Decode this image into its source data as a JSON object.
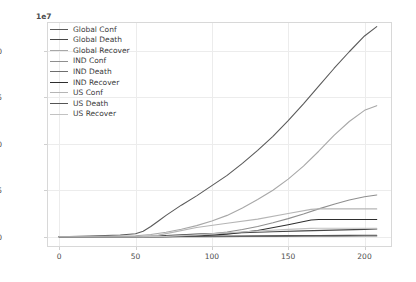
{
  "chart_data": {
    "type": "line",
    "title": "",
    "xlabel": "",
    "ylabel": "",
    "offset_text": "1e7",
    "xlim": [
      -8,
      218
    ],
    "ylim": [
      -1100000,
      23100000
    ],
    "xticks": [
      0,
      50,
      100,
      150,
      200
    ],
    "xtick_labels": [
      "0",
      "50",
      "100",
      "150",
      "200"
    ],
    "yticks": [
      0,
      5000000,
      10000000,
      15000000,
      20000000
    ],
    "ytick_labels": [
      "0.0",
      "0.5",
      "1.0",
      "1.5",
      "2.0"
    ],
    "grid": true,
    "legend_position": "upper left",
    "series": [
      {
        "name": "Global Conf",
        "color": "#5a5a5a",
        "x": [
          0,
          20,
          40,
          50,
          55,
          60,
          65,
          70,
          80,
          90,
          100,
          110,
          120,
          130,
          140,
          150,
          160,
          170,
          180,
          190,
          200,
          208
        ],
        "values": [
          0,
          75000,
          190000,
          330000,
          600000,
          1100000,
          1700000,
          2300000,
          3400000,
          4400000,
          5500000,
          6600000,
          7900000,
          9300000,
          10800000,
          12500000,
          14300000,
          16200000,
          18100000,
          19900000,
          21600000,
          22600000
        ]
      },
      {
        "name": "Global Death",
        "color": "#474747",
        "x": [
          0,
          20,
          40,
          50,
          60,
          70,
          80,
          90,
          100,
          120,
          140,
          160,
          180,
          200,
          208
        ],
        "values": [
          0,
          2000,
          8000,
          18000,
          60000,
          120000,
          200000,
          280000,
          340000,
          440000,
          540000,
          630000,
          720000,
          800000,
          830000
        ]
      },
      {
        "name": "Global Recover",
        "color": "#a8a8a8",
        "x": [
          0,
          20,
          40,
          50,
          60,
          70,
          80,
          90,
          100,
          110,
          120,
          130,
          140,
          150,
          160,
          170,
          180,
          190,
          200,
          208
        ],
        "values": [
          0,
          20000,
          70000,
          110000,
          250000,
          480000,
          800000,
          1200000,
          1700000,
          2300000,
          3100000,
          4000000,
          5000000,
          6200000,
          7600000,
          9200000,
          10900000,
          12400000,
          13600000,
          14100000
        ]
      },
      {
        "name": "IND Conf",
        "color": "#8f8f8f",
        "x": [
          0,
          30,
          50,
          60,
          70,
          80,
          90,
          100,
          110,
          120,
          130,
          140,
          150,
          160,
          170,
          180,
          190,
          200,
          208
        ],
        "values": [
          0,
          1000,
          3000,
          10000,
          30000,
          80000,
          170000,
          320000,
          520000,
          790000,
          1100000,
          1500000,
          1950000,
          2450000,
          3000000,
          3500000,
          3950000,
          4300000,
          4500000
        ]
      },
      {
        "name": "IND Death",
        "color": "#6e6e6e",
        "x": [
          0,
          50,
          80,
          100,
          120,
          140,
          160,
          180,
          200,
          208
        ],
        "values": [
          0,
          100,
          2500,
          9000,
          27000,
          45000,
          58000,
          68000,
          76000,
          78000
        ]
      },
      {
        "name": "IND Recover",
        "color": "#2e2e2e",
        "x": [
          0,
          50,
          70,
          90,
          110,
          130,
          150,
          165,
          170,
          180,
          190,
          200,
          208
        ],
        "values": [
          0,
          500,
          8000,
          75000,
          280000,
          680000,
          1300000,
          1800000,
          1850000,
          1850000,
          1850000,
          1850000,
          1850000
        ]
      },
      {
        "name": "US Conf",
        "color": "#b5b5b5",
        "x": [
          0,
          40,
          55,
          65,
          75,
          90,
          110,
          130,
          150,
          165,
          170,
          185,
          200,
          208
        ],
        "values": [
          0,
          100,
          15000,
          180000,
          500000,
          1000000,
          1450000,
          1900000,
          2500000,
          2950000,
          3000000,
          3000000,
          3000000,
          3000000
        ]
      },
      {
        "name": "US Death",
        "color": "#555555",
        "x": [
          0,
          40,
          55,
          65,
          75,
          90,
          110,
          130,
          150,
          170,
          190,
          200,
          208
        ],
        "values": [
          0,
          10,
          1000,
          12000,
          45000,
          72000,
          88000,
          103000,
          120000,
          140000,
          155000,
          162000,
          165000
        ]
      },
      {
        "name": "US Recover",
        "color": "#c2c2c2",
        "x": [
          0,
          50,
          70,
          90,
          110,
          130,
          150,
          165,
          170,
          185,
          200,
          208
        ],
        "values": [
          0,
          300,
          40000,
          200000,
          420000,
          620000,
          800000,
          900000,
          920000,
          920000,
          920000,
          920000
        ]
      }
    ]
  }
}
